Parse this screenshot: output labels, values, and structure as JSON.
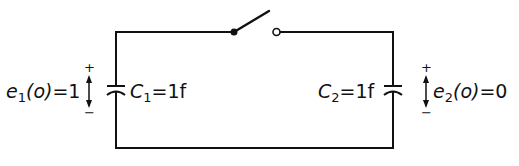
{
  "diagram": {
    "type": "circuit",
    "switch": {
      "state": "open"
    },
    "capacitors": [
      {
        "id": "C1",
        "symbol": "C",
        "subscript": "1",
        "value": "1f",
        "label_eq": "=1f"
      },
      {
        "id": "C2",
        "symbol": "C",
        "subscript": "2",
        "value": "1f",
        "label_eq": "=1f"
      }
    ],
    "initial_voltages": [
      {
        "symbol": "e",
        "subscript": "1",
        "arg": "(o)",
        "value": "=1",
        "plus": "+",
        "minus": "−"
      },
      {
        "symbol": "e",
        "subscript": "2",
        "arg": "(o)",
        "value": "=0",
        "plus": "+",
        "minus": "−"
      }
    ]
  },
  "colors": {
    "stroke": "#111111",
    "background": "#ffffff"
  }
}
